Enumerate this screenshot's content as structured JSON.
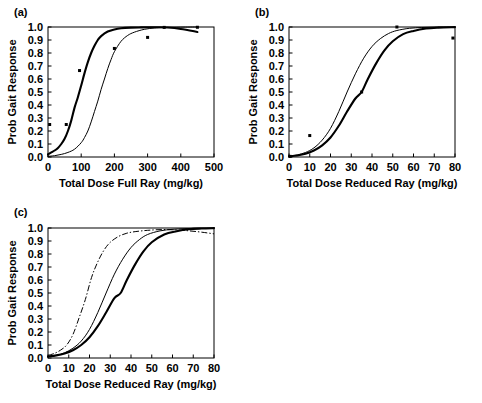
{
  "figure": {
    "width": 482,
    "height": 403,
    "background": "#ffffff",
    "ink": "#000000"
  },
  "chart_data": [
    {
      "id": "a",
      "panel_label": "(a)",
      "type": "line",
      "title": "",
      "xlabel": "Total Dose Full Ray (mg/kg)",
      "ylabel": "Prob Gait Response",
      "xlim": [
        0,
        500
      ],
      "ylim": [
        0,
        1
      ],
      "xticks": [
        0,
        100,
        200,
        300,
        400,
        500
      ],
      "xtick_labels": [
        "0",
        "100",
        "200",
        "300",
        "400",
        "500"
      ],
      "yticks": [
        0.0,
        0.1,
        0.2,
        0.3,
        0.4,
        0.5,
        0.6,
        0.7,
        0.8,
        0.9,
        1.0
      ],
      "ytick_labels": [
        "0.0",
        "0.1",
        "0.2",
        "0.3",
        "0.4",
        "0.5",
        "0.6",
        "0.7",
        "0.8",
        "0.9",
        "1.0"
      ],
      "grid": false,
      "legend": "none",
      "series": [
        {
          "name": "fitted curve thick",
          "style": "solid-thick",
          "ed50": 103,
          "slope": 0.0345,
          "x": [
            0,
            10,
            20,
            30,
            40,
            50,
            60,
            70,
            80,
            90,
            100,
            110,
            120,
            130,
            140,
            150,
            160,
            180,
            200,
            220,
            250,
            280,
            300,
            330,
            360,
            400,
            450
          ],
          "values": [
            0.02,
            0.035,
            0.05,
            0.07,
            0.1,
            0.14,
            0.2,
            0.28,
            0.38,
            0.46,
            0.55,
            0.645,
            0.73,
            0.8,
            0.855,
            0.9,
            0.93,
            0.965,
            0.981,
            0.99,
            0.995,
            0.997,
            0.998,
            0.998,
            0.996,
            0.985,
            0.962
          ]
        },
        {
          "name": "fitted curve thin",
          "style": "solid-thin",
          "ed50": 160,
          "slope": 0.0265,
          "x": [
            0,
            20,
            40,
            60,
            80,
            100,
            110,
            120,
            130,
            140,
            150,
            160,
            170,
            180,
            190,
            200,
            220,
            240,
            260,
            290,
            320,
            350,
            400,
            450
          ],
          "values": [
            0.005,
            0.01,
            0.02,
            0.035,
            0.06,
            0.11,
            0.15,
            0.2,
            0.27,
            0.35,
            0.43,
            0.52,
            0.6,
            0.68,
            0.75,
            0.81,
            0.89,
            0.935,
            0.96,
            0.982,
            0.992,
            0.996,
            0.999,
            1.0
          ]
        }
      ],
      "points": [
        {
          "x": 5,
          "y": 0.25
        },
        {
          "x": 55,
          "y": 0.25
        },
        {
          "x": 95,
          "y": 0.665
        },
        {
          "x": 200,
          "y": 0.835
        },
        {
          "x": 300,
          "y": 0.92
        },
        {
          "x": 350,
          "y": 0.997
        },
        {
          "x": 450,
          "y": 0.998
        }
      ]
    },
    {
      "id": "b",
      "panel_label": "(b)",
      "type": "line",
      "title": "",
      "xlabel": "Total Dose Reduced Ray (mg/kg)",
      "ylabel": "Prob Gait Response",
      "xlim": [
        0,
        80
      ],
      "ylim": [
        0,
        1
      ],
      "xticks": [
        0,
        10,
        20,
        30,
        40,
        50,
        60,
        70,
        80
      ],
      "xtick_labels": [
        "0",
        "10",
        "20",
        "30",
        "40",
        "50",
        "60",
        "70",
        "80"
      ],
      "yticks": [
        0.0,
        0.1,
        0.2,
        0.3,
        0.4,
        0.5,
        0.6,
        0.7,
        0.8,
        0.9,
        1.0
      ],
      "ytick_labels": [
        "0.0",
        "0.1",
        "0.2",
        "0.3",
        "0.4",
        "0.5",
        "0.6",
        "0.7",
        "0.8",
        "0.9",
        "1.0"
      ],
      "grid": false,
      "legend": "none",
      "series": [
        {
          "name": "fitted curve thick",
          "style": "solid-thick",
          "ed50": 35,
          "slope": 0.135,
          "x": [
            0,
            4,
            8,
            12,
            16,
            20,
            24,
            28,
            32,
            35,
            38,
            42,
            46,
            50,
            55,
            60,
            66,
            72,
            80
          ],
          "values": [
            0.005,
            0.012,
            0.025,
            0.05,
            0.09,
            0.15,
            0.24,
            0.35,
            0.45,
            0.5,
            0.6,
            0.72,
            0.82,
            0.89,
            0.945,
            0.97,
            0.988,
            0.995,
            0.999
          ]
        },
        {
          "name": "fitted curve thin",
          "style": "solid-thin",
          "ed50": 28,
          "slope": 0.155,
          "x": [
            0,
            4,
            8,
            12,
            16,
            20,
            24,
            28,
            32,
            36,
            40,
            44,
            48,
            52,
            58,
            64,
            70,
            76,
            80
          ],
          "values": [
            0.006,
            0.016,
            0.035,
            0.07,
            0.13,
            0.22,
            0.35,
            0.5,
            0.64,
            0.76,
            0.85,
            0.91,
            0.95,
            0.973,
            0.99,
            0.996,
            0.999,
            1.0,
            1.0
          ]
        }
      ],
      "points": [
        {
          "x": 0.5,
          "y": 0.005
        },
        {
          "x": 10,
          "y": 0.165
        },
        {
          "x": 35,
          "y": 0.5
        },
        {
          "x": 52,
          "y": 1.0
        },
        {
          "x": 79,
          "y": 0.915
        }
      ]
    },
    {
      "id": "c",
      "panel_label": "(c)",
      "type": "line",
      "title": "",
      "xlabel": "Total Dose Reduced Ray (mg/kg)",
      "ylabel": "Prob Gait Response",
      "xlim": [
        0,
        80
      ],
      "ylim": [
        0,
        1
      ],
      "xticks": [
        0,
        10,
        20,
        30,
        40,
        50,
        60,
        70,
        80
      ],
      "xtick_labels": [
        "0",
        "10",
        "20",
        "30",
        "40",
        "50",
        "60",
        "70",
        "80"
      ],
      "yticks": [
        0.0,
        0.1,
        0.2,
        0.3,
        0.4,
        0.5,
        0.6,
        0.7,
        0.8,
        0.9,
        1.0
      ],
      "ytick_labels": [
        "0.0",
        "0.1",
        "0.2",
        "0.3",
        "0.4",
        "0.5",
        "0.6",
        "0.7",
        "0.8",
        "0.9",
        "1.0"
      ],
      "grid": false,
      "legend": "none",
      "series": [
        {
          "name": "curve dash-dot (leftmost)",
          "style": "dash-dot",
          "ed50": 19,
          "slope": 0.17,
          "x": [
            0,
            3,
            6,
            9,
            12,
            15,
            18,
            21,
            24,
            27,
            30,
            34,
            38,
            42,
            48,
            55,
            62,
            68,
            74,
            80
          ],
          "values": [
            0.02,
            0.035,
            0.06,
            0.1,
            0.18,
            0.31,
            0.45,
            0.62,
            0.74,
            0.83,
            0.89,
            0.935,
            0.96,
            0.972,
            0.982,
            0.988,
            0.985,
            0.978,
            0.968,
            0.955
          ]
        },
        {
          "name": "curve thin (middle)",
          "style": "solid-thin",
          "ed50": 28,
          "slope": 0.155,
          "x": [
            0,
            4,
            8,
            12,
            16,
            20,
            24,
            28,
            32,
            36,
            40,
            44,
            48,
            54,
            60,
            66,
            72,
            80
          ],
          "values": [
            0.012,
            0.02,
            0.04,
            0.075,
            0.13,
            0.22,
            0.35,
            0.5,
            0.645,
            0.76,
            0.85,
            0.91,
            0.95,
            0.978,
            0.99,
            0.995,
            0.998,
            1.0
          ]
        },
        {
          "name": "curve thick (rightmost)",
          "style": "solid-thick",
          "ed50": 35,
          "slope": 0.135,
          "x": [
            0,
            4,
            8,
            12,
            16,
            20,
            24,
            28,
            32,
            35,
            38,
            42,
            46,
            50,
            56,
            62,
            68,
            74,
            80
          ],
          "values": [
            0.012,
            0.02,
            0.035,
            0.06,
            0.1,
            0.16,
            0.245,
            0.35,
            0.46,
            0.5,
            0.6,
            0.72,
            0.82,
            0.89,
            0.95,
            0.975,
            0.99,
            0.996,
            0.999
          ]
        }
      ],
      "points": []
    }
  ]
}
